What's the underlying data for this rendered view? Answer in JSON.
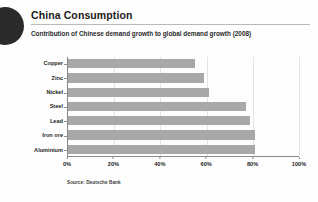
{
  "header": {
    "title": "China Consumption",
    "subtitle": "Contribution of Chinese demand growth to global demand growth (2008)",
    "logo_icon": "dark-semicircle-logo"
  },
  "footer": {
    "source": "Source: Deutsche Bank"
  },
  "colors": {
    "bar": "#a8a8a8",
    "axis": "#8a8a8a",
    "grid": "#e3e3e3",
    "text": "#1f1f1f",
    "logo": "#2b2b2b",
    "background": "#fdfdfd"
  },
  "chart_data": {
    "type": "bar",
    "orientation": "horizontal",
    "title": "China Consumption",
    "subtitle": "Contribution of Chinese demand growth to global demand growth (2008)",
    "categories": [
      "Copper",
      "Zinc",
      "Nickel",
      "Steel",
      "Lead",
      "Iron ore",
      "Aluminium"
    ],
    "values": [
      55,
      59,
      61,
      77,
      79,
      81,
      81
    ],
    "unit": "%",
    "xlabel": "",
    "ylabel": "",
    "xlim": [
      0,
      100
    ],
    "xticks": [
      0,
      20,
      40,
      60,
      80,
      100
    ],
    "xtick_labels": [
      "0%",
      "20%",
      "40%",
      "60%",
      "80%",
      "100%"
    ],
    "grid": true,
    "legend": false,
    "source": "Source: Deutsche Bank"
  }
}
